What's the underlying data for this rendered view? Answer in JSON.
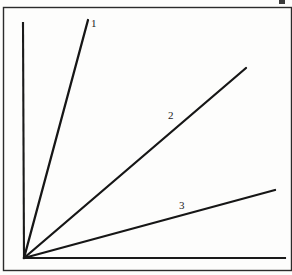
{
  "figure": {
    "background_color": "#fdfdfc",
    "ink_color": "#1a1a1a",
    "frame": {
      "name": "outer-border",
      "x": 3,
      "y": 7,
      "width": 288,
      "height": 263,
      "stroke_color": "#2b2b2b"
    },
    "corner_mark": {
      "x": 279,
      "y": 0,
      "width": 6,
      "height": 4
    }
  },
  "chart_data": {
    "type": "line",
    "title": "",
    "subtitle": "",
    "xlabel": "",
    "ylabel": "",
    "grid": false,
    "legend": "inline-labels",
    "axes": {
      "origin": {
        "x": 24,
        "y": 258
      },
      "y_axis": {
        "x1": 24,
        "y1": 258,
        "x2": 23,
        "y2": 23
      },
      "x_axis": {
        "x1": 24,
        "y1": 258,
        "x2": 285,
        "y2": 258
      },
      "xlim": [
        0,
        261
      ],
      "ylim": [
        0,
        235
      ],
      "tick_labels_x": [],
      "tick_labels_y": []
    },
    "series": [
      {
        "name": "1",
        "label": "1",
        "x": [
          0,
          64
        ],
        "y": [
          0,
          238
        ],
        "pixel_start": {
          "x": 24,
          "y": 258
        },
        "pixel_end": {
          "x": 88,
          "y": 20
        },
        "slope": 3.72,
        "color": "#161616",
        "label_position": {
          "x": 91,
          "y": 18
        }
      },
      {
        "name": "2",
        "label": "2",
        "x": [
          0,
          222
        ],
        "y": [
          0,
          190
        ],
        "pixel_start": {
          "x": 24,
          "y": 258
        },
        "pixel_end": {
          "x": 246,
          "y": 68
        },
        "slope": 0.856,
        "color": "#161616",
        "label_position": {
          "x": 168,
          "y": 110
        }
      },
      {
        "name": "3",
        "label": "3",
        "x": [
          0,
          251
        ],
        "y": [
          0,
          68
        ],
        "pixel_start": {
          "x": 24,
          "y": 258
        },
        "pixel_end": {
          "x": 275,
          "y": 190
        },
        "slope": 0.271,
        "color": "#161616",
        "label_position": {
          "x": 179,
          "y": 200
        }
      }
    ],
    "annotations": [
      {
        "text": "1",
        "x": 91,
        "y": 18
      },
      {
        "text": "2",
        "x": 168,
        "y": 110
      },
      {
        "text": "3",
        "x": 179,
        "y": 200
      }
    ]
  }
}
